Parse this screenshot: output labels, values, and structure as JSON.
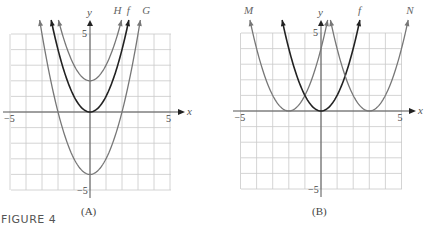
{
  "figure_title": "FIGURE 4",
  "chart_data": [
    {
      "type": "line",
      "panel": "A",
      "caption": "(A)",
      "xlabel": "x",
      "ylabel": "y",
      "xlim": [
        -5,
        5
      ],
      "ylim": [
        -5,
        5
      ],
      "x_tick_labels": [
        "-5",
        "5"
      ],
      "y_tick_labels": [
        "5",
        "-5"
      ],
      "grid": true,
      "series": [
        {
          "name": "H",
          "function": "x^2 + 2",
          "vertex": [
            0,
            2
          ],
          "color": "#777777"
        },
        {
          "name": "f",
          "function": "x^2",
          "vertex": [
            0,
            0
          ],
          "color": "#222222"
        },
        {
          "name": "G",
          "function": "x^2 - 4",
          "vertex": [
            0,
            -4
          ],
          "color": "#777777"
        }
      ]
    },
    {
      "type": "line",
      "panel": "B",
      "caption": "(B)",
      "xlabel": "x",
      "ylabel": "y",
      "xlim": [
        -5,
        5
      ],
      "ylim": [
        -5,
        5
      ],
      "x_tick_labels": [
        "-5",
        "5"
      ],
      "y_tick_labels": [
        "5",
        "-5"
      ],
      "grid": true,
      "series": [
        {
          "name": "M",
          "function": "(x + 2)^2",
          "vertex": [
            -2,
            0
          ],
          "color": "#777777"
        },
        {
          "name": "f",
          "function": "x^2",
          "vertex": [
            0,
            0
          ],
          "color": "#222222"
        },
        {
          "name": "N",
          "function": "(x - 3)^2",
          "vertex": [
            3,
            0
          ],
          "color": "#777777"
        }
      ]
    }
  ]
}
